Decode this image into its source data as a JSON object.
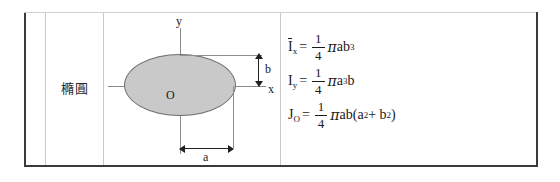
{
  "table": {
    "row_label": "橢圓"
  },
  "figure": {
    "name": "ellipse-cross-section",
    "axis_y_label": "y",
    "axis_x_label": "x",
    "origin_label": "O",
    "dimension_b_label": "b",
    "dimension_a_label": "a",
    "fill_color": "#c9c9c9",
    "outline_color": "#6e6e6e",
    "axis_color": "#8a8a8a"
  },
  "formulas": [
    {
      "id": "ix",
      "symbol": "I",
      "symbol_overbar": true,
      "subscript": "x",
      "equals": "=",
      "numerator": "1",
      "denominator": "4",
      "pi": "π",
      "body": "ab",
      "body_exponent": "3",
      "text": "Ix = (1/4)πab³"
    },
    {
      "id": "iy",
      "symbol": "I",
      "symbol_overbar": false,
      "subscript": "y",
      "equals": "=",
      "numerator": "1",
      "denominator": "4",
      "pi": "π",
      "body": "a",
      "body_exponent": "3",
      "body_tail": "b",
      "text": "Iy = (1/4)πa³b"
    },
    {
      "id": "jo",
      "symbol": "J",
      "symbol_overbar": false,
      "subscript": "O",
      "equals": "=",
      "numerator": "1",
      "denominator": "4",
      "pi": "π",
      "body": "ab(a",
      "body_exponent": "2",
      "body_mid": " + b",
      "body_exponent2": "2",
      "body_tail": ")",
      "text": "JO = (1/4)πab(a² + b²)"
    }
  ]
}
